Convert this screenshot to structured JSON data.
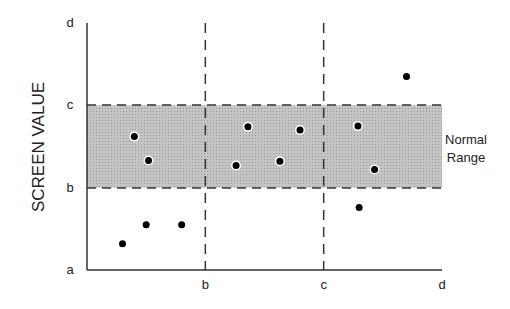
{
  "chart_data": {
    "type": "scatter",
    "title": "",
    "xlabel": "",
    "ylabel": "SCREEN VALUE",
    "x_ticks": [
      "b",
      "c",
      "d"
    ],
    "y_ticks": [
      "a",
      "b",
      "c",
      "d"
    ],
    "origin_label": "a",
    "xlim": [
      0,
      3
    ],
    "ylim": [
      0,
      3
    ],
    "tick_scale_note": "a=0, b=1, c=2, d=3",
    "grid": false,
    "vertical_reference_lines": [
      1,
      2
    ],
    "shaded_band": {
      "label_line1": "Normal",
      "label_line2": "Range",
      "ymin": 1,
      "ymax": 2
    },
    "points": [
      {
        "x": 0.3,
        "y": 0.32
      },
      {
        "x": 0.5,
        "y": 0.55
      },
      {
        "x": 0.8,
        "y": 0.55
      },
      {
        "x": 0.4,
        "y": 1.62
      },
      {
        "x": 0.52,
        "y": 1.33
      },
      {
        "x": 1.36,
        "y": 1.74
      },
      {
        "x": 1.26,
        "y": 1.27
      },
      {
        "x": 1.8,
        "y": 1.7
      },
      {
        "x": 1.63,
        "y": 1.32
      },
      {
        "x": 2.29,
        "y": 1.75
      },
      {
        "x": 2.43,
        "y": 1.22
      },
      {
        "x": 2.3,
        "y": 0.76
      },
      {
        "x": 2.7,
        "y": 2.35
      }
    ]
  }
}
